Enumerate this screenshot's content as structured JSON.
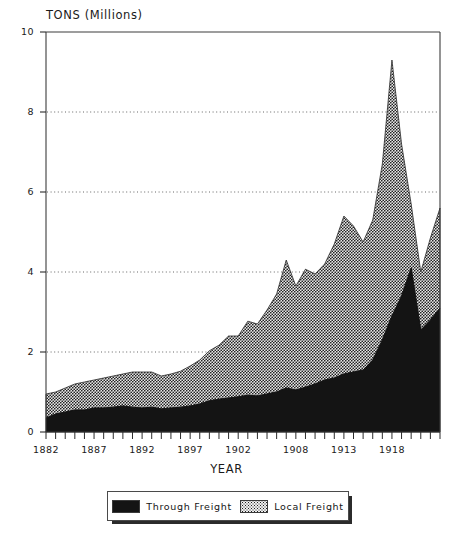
{
  "chart_data": {
    "type": "area",
    "title": "",
    "ylabel": "TONS (Millions)",
    "xlabel": "YEAR",
    "ylim": [
      0,
      10
    ],
    "yticks": [
      0,
      2,
      4,
      6,
      8,
      10
    ],
    "xlim": [
      1882,
      1923
    ],
    "xticks": [
      1882,
      1887,
      1892,
      1897,
      1902,
      1908,
      1913,
      1918
    ],
    "grid": "horizontal-dotted",
    "stacked": true,
    "legend_position": "bottom",
    "x": [
      1882,
      1883,
      1884,
      1885,
      1886,
      1887,
      1888,
      1889,
      1890,
      1891,
      1892,
      1893,
      1894,
      1895,
      1896,
      1897,
      1898,
      1899,
      1900,
      1901,
      1902,
      1903,
      1904,
      1905,
      1906,
      1907,
      1908,
      1909,
      1910,
      1911,
      1912,
      1913,
      1914,
      1915,
      1916,
      1917,
      1918,
      1919,
      1920,
      1921,
      1922,
      1923
    ],
    "series": [
      {
        "name": "Through Freight",
        "color": "#141414",
        "values": [
          0.35,
          0.45,
          0.5,
          0.55,
          0.55,
          0.6,
          0.6,
          0.62,
          0.65,
          0.62,
          0.6,
          0.62,
          0.58,
          0.6,
          0.62,
          0.65,
          0.7,
          0.78,
          0.82,
          0.85,
          0.88,
          0.92,
          0.9,
          0.95,
          1.0,
          1.1,
          1.05,
          1.12,
          1.2,
          1.3,
          1.35,
          1.45,
          1.5,
          1.55,
          1.8,
          2.3,
          2.9,
          3.4,
          4.1,
          2.55,
          2.8,
          3.1
        ]
      },
      {
        "name": "Local Freight",
        "color": "#6e6e6e",
        "values": [
          0.6,
          0.55,
          0.6,
          0.65,
          0.7,
          0.7,
          0.75,
          0.78,
          0.8,
          0.88,
          0.9,
          0.88,
          0.82,
          0.85,
          0.9,
          1.0,
          1.1,
          1.25,
          1.35,
          1.55,
          1.52,
          1.85,
          1.8,
          2.1,
          2.45,
          3.2,
          2.6,
          2.95,
          2.75,
          2.9,
          3.35,
          3.95,
          3.65,
          3.2,
          3.5,
          4.4,
          6.4,
          3.8,
          1.6,
          1.45,
          2.05,
          2.5
        ]
      }
    ],
    "totals": [
      0.95,
      1.0,
      1.1,
      1.2,
      1.25,
      1.3,
      1.35,
      1.4,
      1.45,
      1.5,
      1.5,
      1.5,
      1.4,
      1.45,
      1.52,
      1.65,
      1.8,
      2.03,
      2.17,
      2.4,
      2.4,
      2.77,
      2.7,
      3.05,
      3.45,
      4.3,
      3.65,
      4.07,
      3.95,
      4.2,
      4.7,
      5.4,
      5.15,
      4.75,
      5.3,
      6.7,
      9.3,
      7.2,
      5.7,
      4.0,
      4.85,
      5.6
    ]
  },
  "legend": {
    "items": [
      {
        "label": "Through Freight",
        "swatch": "solid-black-swatch"
      },
      {
        "label": "Local Freight",
        "swatch": "dotted-gray-swatch"
      }
    ]
  }
}
